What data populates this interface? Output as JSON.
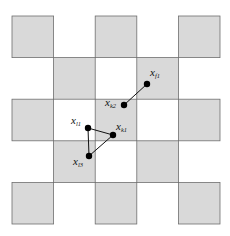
{
  "diagram": {
    "type": "checkerboard-grid-with-points",
    "grid": {
      "rows": 5,
      "cols": 5,
      "origin": [
        12,
        16
      ],
      "cell_size": 41.6,
      "shaded_pattern": "checkerboard starting with top-left shaded",
      "shaded_color": "#d9d9d9",
      "border_color": "#6e6e6e"
    },
    "points": [
      {
        "id": "xf1",
        "label": "x",
        "subscript": "f1",
        "x": 147,
        "y": 84
      },
      {
        "id": "xk2",
        "label": "x",
        "subscript": "k2",
        "x": 124,
        "y": 105
      },
      {
        "id": "xl1",
        "label": "x",
        "subscript": "l1",
        "x": 88,
        "y": 128
      },
      {
        "id": "xk1",
        "label": "x",
        "subscript": "k1",
        "x": 113,
        "y": 135
      },
      {
        "id": "xl3",
        "label": "x",
        "subscript": "l3",
        "x": 89,
        "y": 156
      }
    ],
    "edges": [
      [
        "xf1",
        "xk2"
      ],
      [
        "xl1",
        "xk1"
      ],
      [
        "xl1",
        "xl3"
      ],
      [
        "xl3",
        "xk1"
      ]
    ]
  }
}
